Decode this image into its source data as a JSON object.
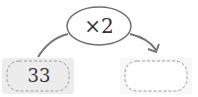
{
  "diagram": {
    "operator": {
      "label": "×2",
      "shape": "ellipse"
    },
    "input": {
      "value": "33",
      "fill": "#ececec"
    },
    "output": {
      "value": "",
      "fill": "#ffffff"
    },
    "arrow": {
      "direction": "input-to-output",
      "color": "#777777"
    },
    "colors": {
      "stroke": "#6f6f6f",
      "dash": "#9a9a9a",
      "text": "#333333"
    }
  }
}
